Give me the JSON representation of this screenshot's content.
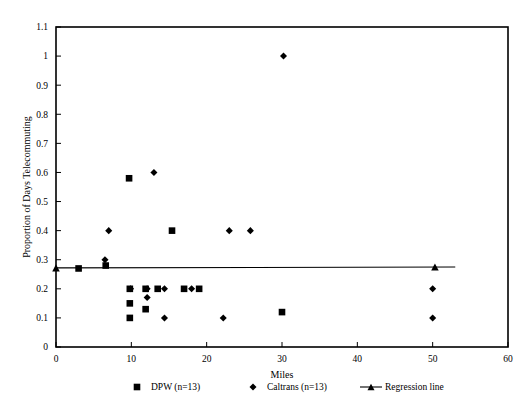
{
  "chart_data": {
    "type": "scatter",
    "title": "",
    "xlabel": "Miles",
    "ylabel": "Proportion of Days Telecommuting",
    "xlim": [
      0,
      60
    ],
    "ylim": [
      0,
      1.1
    ],
    "xticks": [
      "0",
      "10",
      "20",
      "30",
      "40",
      "50",
      "60"
    ],
    "xtick_values": [
      0,
      10,
      20,
      30,
      40,
      50,
      60
    ],
    "yticks": [
      "0",
      "0.1",
      "0.2",
      "0.3",
      "0.4",
      "0.5",
      "0.6",
      "0.7",
      "0.8",
      "0.9",
      "1",
      "1.1"
    ],
    "ytick_values": [
      0,
      0.1,
      0.2,
      0.3,
      0.4,
      0.5,
      0.6,
      0.7,
      0.8,
      0.9,
      1.0,
      1.1
    ],
    "grid": false,
    "legend_position": "bottom",
    "series": [
      {
        "name": "DPW (n=13)",
        "marker": "square",
        "color": "#000000",
        "points": [
          {
            "x": 3.0,
            "y": 0.27
          },
          {
            "x": 6.6,
            "y": 0.28
          },
          {
            "x": 9.7,
            "y": 0.58
          },
          {
            "x": 9.8,
            "y": 0.2
          },
          {
            "x": 9.8,
            "y": 0.15
          },
          {
            "x": 9.8,
            "y": 0.1
          },
          {
            "x": 11.9,
            "y": 0.2
          },
          {
            "x": 11.9,
            "y": 0.13
          },
          {
            "x": 13.5,
            "y": 0.2
          },
          {
            "x": 15.4,
            "y": 0.4
          },
          {
            "x": 17.0,
            "y": 0.2
          },
          {
            "x": 19.0,
            "y": 0.2
          },
          {
            "x": 30.0,
            "y": 0.12
          }
        ]
      },
      {
        "name": "Caltrans (n=13)",
        "marker": "diamond",
        "color": "#000000",
        "points": [
          {
            "x": 6.5,
            "y": 0.3
          },
          {
            "x": 7.0,
            "y": 0.4
          },
          {
            "x": 9.9,
            "y": 0.2
          },
          {
            "x": 12.1,
            "y": 0.2
          },
          {
            "x": 12.1,
            "y": 0.17
          },
          {
            "x": 13.0,
            "y": 0.6
          },
          {
            "x": 14.4,
            "y": 0.2
          },
          {
            "x": 14.4,
            "y": 0.1
          },
          {
            "x": 18.0,
            "y": 0.2
          },
          {
            "x": 22.2,
            "y": 0.1
          },
          {
            "x": 23.0,
            "y": 0.4
          },
          {
            "x": 25.8,
            "y": 0.4
          },
          {
            "x": 30.2,
            "y": 1.0
          },
          {
            "x": 50.0,
            "y": 0.2
          },
          {
            "x": 50.0,
            "y": 0.1
          }
        ]
      }
    ],
    "regression_line": {
      "name": "Regression line",
      "marker": "triangle",
      "color": "#000000",
      "x_start": 0.0,
      "y_start": 0.272,
      "x_end": 50.3,
      "y_end": 0.275,
      "endpoint_markers": [
        {
          "x": 0.0,
          "y": 0.272
        },
        {
          "x": 50.3,
          "y": 0.275
        }
      ],
      "tail_x_end": 53.0
    },
    "legend": [
      {
        "label": "DPW (n=13)",
        "marker": "square"
      },
      {
        "label": "Caltrans (n=13)",
        "marker": "diamond"
      },
      {
        "label": "Regression line",
        "marker": "line-triangle"
      }
    ]
  }
}
